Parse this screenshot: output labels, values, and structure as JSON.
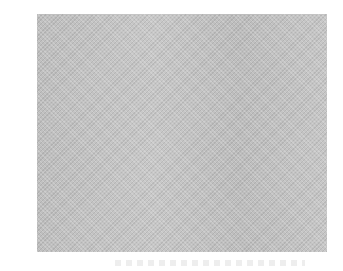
{
  "image": {
    "description": "Gray noise-textured rectangular panel on white background",
    "panel_color": "#c4c4c4",
    "background_color": "#ffffff",
    "caption_text": ""
  }
}
